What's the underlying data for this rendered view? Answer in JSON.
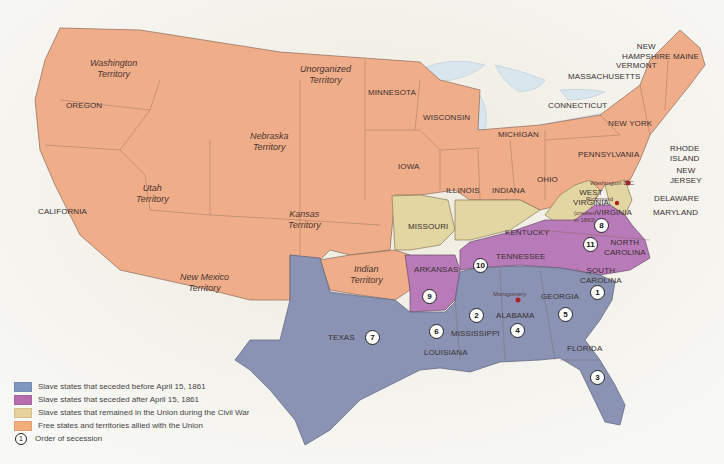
{
  "colors": {
    "seceded_before": "#8a93b4",
    "seceded_after": "#b87ab8",
    "remained_union_slave": "#e2d6a2",
    "free_union": "#f0ad8a",
    "background": "#f4f2ec",
    "water": "#dfe9ef",
    "capital_dot": "#b0202a"
  },
  "legend": {
    "items": [
      {
        "label": "Slave states that seceded before April 15, 1861",
        "color": "#7f97c0"
      },
      {
        "label": "Slave states that seceded after April 15, 1861",
        "color": "#b86cb0"
      },
      {
        "label": "Slave states that remained in the Union during the Civil War",
        "color": "#e6d29a"
      },
      {
        "label": "Free states and territories allied with the Union",
        "color": "#f3ad7c"
      }
    ],
    "order_symbol": "1",
    "order_label": "Order of secession"
  },
  "territories": {
    "washington": [
      "Washington",
      "Territory"
    ],
    "unorganized": [
      "Unorganized",
      "Territory"
    ],
    "nebraska": [
      "Nebraska",
      "Territory"
    ],
    "utah": [
      "Utah",
      "Territory"
    ],
    "kansas": [
      "Kansas",
      "Territory"
    ],
    "new_mexico": [
      "New Mexico",
      "Territory"
    ],
    "indian": [
      "Indian",
      "Territory"
    ]
  },
  "states": {
    "oregon": "OREGON",
    "california": "CALIFORNIA",
    "minnesota": "MINNESOTA",
    "wisconsin": "WISCONSIN",
    "michigan": "MICHIGAN",
    "iowa": "IOWA",
    "illinois": "ILLINOIS",
    "indiana": "INDIANA",
    "ohio": "OHIO",
    "pennsylvania": "PENNSYLVANIA",
    "new_york": "NEW YORK",
    "connecticut": "CONNECTICUT",
    "massachusetts": "MASSACHUSETTS",
    "vermont": "VERMONT",
    "new_hampshire": [
      "NEW",
      "HAMPSHIRE"
    ],
    "maine": "MAINE",
    "rhode_island": [
      "RHODE",
      "ISLAND"
    ],
    "new_jersey": [
      "NEW",
      "JERSEY"
    ],
    "delaware": "DELAWARE",
    "maryland": "MARYLAND",
    "west_virginia": [
      "WEST",
      "VIRGINIA"
    ],
    "west_virginia_note": [
      "(created",
      "in 1863)"
    ],
    "missouri": "MISSOURI",
    "kentucky": "KENTUCKY",
    "virginia": "VIRGINIA",
    "north_carolina": [
      "NORTH",
      "CAROLINA"
    ],
    "tennessee": "TENNESSEE",
    "arkansas": "ARKANSAS",
    "south_carolina": [
      "SOUTH",
      "CAROLINA"
    ],
    "georgia": "GEORGIA",
    "alabama": "ALABAMA",
    "mississippi": "MISSISSIPPI",
    "louisiana": "LOUISIANA",
    "texas": "TEXAS",
    "florida": "FLORIDA"
  },
  "cities": {
    "washington_dc": "Washington D.C.",
    "richmond": "Richmond",
    "montgomery": "Montgomery"
  },
  "secession_order": [
    {
      "state": "South Carolina",
      "order": "1"
    },
    {
      "state": "Mississippi",
      "order": "2"
    },
    {
      "state": "Florida",
      "order": "3"
    },
    {
      "state": "Alabama",
      "order": "4"
    },
    {
      "state": "Georgia",
      "order": "5"
    },
    {
      "state": "Louisiana",
      "order": "6"
    },
    {
      "state": "Texas",
      "order": "7"
    },
    {
      "state": "Virginia",
      "order": "8"
    },
    {
      "state": "Arkansas",
      "order": "9"
    },
    {
      "state": "Tennessee",
      "order": "10"
    },
    {
      "state": "North Carolina",
      "order": "11"
    }
  ]
}
